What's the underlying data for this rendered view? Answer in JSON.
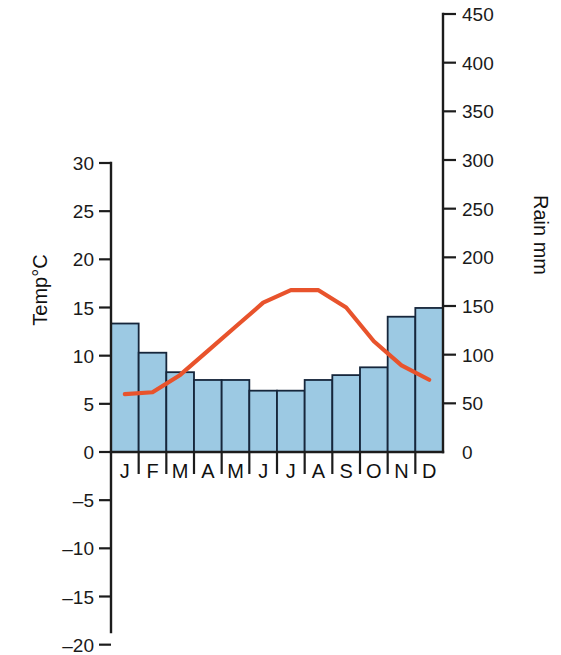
{
  "chart_data": {
    "type": "bar",
    "title": "",
    "subtitle": "",
    "categories": [
      "J",
      "F",
      "M",
      "A",
      "M",
      "J",
      "J",
      "A",
      "S",
      "O",
      "N",
      "D"
    ],
    "month_names": [
      "January",
      "February",
      "March",
      "April",
      "May",
      "June",
      "July",
      "August",
      "September",
      "October",
      "November",
      "December"
    ],
    "series": [
      {
        "name": "Rain mm",
        "type": "bar",
        "axis": "right",
        "color": "#9cc9e3",
        "edge_color": "#16263b",
        "values": [
          132,
          102,
          82,
          74,
          74,
          63,
          63,
          74,
          79,
          87,
          139,
          148
        ]
      },
      {
        "name": "Temp°C",
        "type": "line",
        "axis": "left",
        "color": "#e8532c",
        "values": [
          6.0,
          6.2,
          8.0,
          10.5,
          13.0,
          15.5,
          16.8,
          16.8,
          15.0,
          11.5,
          9.0,
          7.5
        ]
      }
    ],
    "left_axis": {
      "label": "Temp°C",
      "ticks": [
        "30",
        "25",
        "20",
        "15",
        "10",
        "5",
        "0",
        "–5",
        "–10",
        "–15",
        "–20"
      ],
      "tick_values": [
        30,
        25,
        20,
        15,
        10,
        5,
        0,
        -5,
        -10,
        -15,
        -20
      ],
      "min": -20,
      "max": 30,
      "step": 5,
      "unit": "°C"
    },
    "right_axis": {
      "label": "Rain mm",
      "ticks": [
        "450",
        "400",
        "350",
        "300",
        "250",
        "200",
        "150",
        "100",
        "50",
        "0"
      ],
      "tick_values": [
        450,
        400,
        350,
        300,
        250,
        200,
        150,
        100,
        50,
        0
      ],
      "min": 0,
      "max": 450,
      "step": 50,
      "unit": "mm"
    },
    "xlabel": "",
    "grid": false,
    "legend": "none"
  },
  "colors": {
    "bar_fill": "#9cc9e3",
    "bar_edge": "#16263b",
    "line": "#e8532c",
    "axis": "#1c1c1c",
    "text": "#111111",
    "background": "#ffffff"
  }
}
